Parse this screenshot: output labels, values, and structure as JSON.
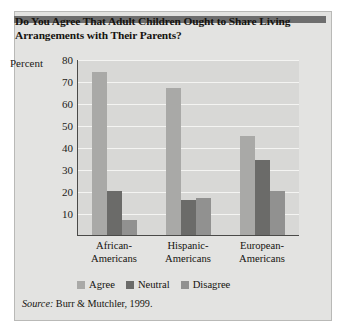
{
  "figure": {
    "title": "Do You Agree That Adult Children Ought to Share Living Arrangements with Their Parents?",
    "source_label": "Source:",
    "source_text": "Burr & Mutchler, 1999."
  },
  "chart_data": {
    "type": "bar",
    "title": "Do You Agree That Adult Children Ought to Share Living Arrangements with Their Parents?",
    "categories": [
      "African-\nAmericans",
      "Hispanic-\nAmericans",
      "European-\nAmericans"
    ],
    "category_lines": [
      [
        "African-",
        "Americans"
      ],
      [
        "Hispanic-",
        "Americans"
      ],
      [
        "European-",
        "Americans"
      ]
    ],
    "series": [
      {
        "name": "Agree",
        "values": [
          74,
          67,
          45
        ],
        "color": "#a9a9a7"
      },
      {
        "name": "Neutral",
        "values": [
          20,
          16,
          34
        ],
        "color": "#6b6b69"
      },
      {
        "name": "Disagree",
        "values": [
          7,
          17,
          20
        ],
        "color": "#919190"
      }
    ],
    "xlabel": "",
    "ylabel": "Percent",
    "ylim": [
      0,
      80
    ],
    "yticks": [
      80,
      70,
      60,
      50,
      40,
      30,
      20,
      10
    ],
    "grid": true,
    "legend_position": "bottom",
    "source": "Burr & Mutchler, 1999."
  },
  "colors": {
    "card_background": "#e3e3e1",
    "plot_background": "#d8d8d6",
    "accent_bar": "#6e6e6e",
    "gridline": "#f4f4f2",
    "axis": "#4a4a48",
    "text": "#15130f"
  }
}
